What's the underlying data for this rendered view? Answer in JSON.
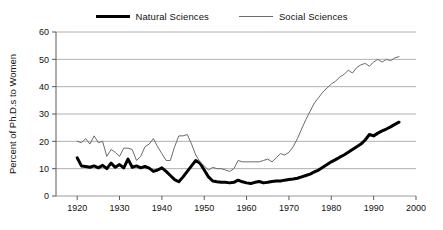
{
  "legend": {
    "position": "top-center",
    "entries": [
      {
        "label": "Natural Sciences",
        "style": "thick",
        "color": "#000000"
      },
      {
        "label": "Social Sciences",
        "style": "thin",
        "color": "#6b6b6b"
      }
    ]
  },
  "axes": {
    "y_title": "Percent of Ph.D.s to Women",
    "y_ticks": [
      "0",
      "10",
      "20",
      "30",
      "40",
      "50",
      "60"
    ],
    "x_ticks": [
      "1920",
      "1930",
      "1940",
      "1950",
      "1960",
      "1970",
      "1980",
      "1990",
      "2000"
    ]
  },
  "chart_data": {
    "type": "line",
    "title": "",
    "xlabel": "",
    "ylabel": "Percent of Ph.D.s to Women",
    "xlim": [
      1915,
      2000
    ],
    "ylim": [
      0,
      60
    ],
    "xticks": [
      1920,
      1930,
      1940,
      1950,
      1960,
      1970,
      1980,
      1990,
      2000
    ],
    "yticks": [
      0,
      10,
      20,
      30,
      40,
      50,
      60
    ],
    "grid": "horizontal",
    "legend_position": "top-center",
    "series": [
      {
        "name": "Natural Sciences",
        "color": "#000000",
        "linewidth": 3,
        "x": [
          1920,
          1921,
          1922,
          1923,
          1924,
          1925,
          1926,
          1927,
          1928,
          1929,
          1930,
          1931,
          1932,
          1933,
          1934,
          1935,
          1936,
          1937,
          1938,
          1939,
          1940,
          1941,
          1942,
          1943,
          1944,
          1945,
          1946,
          1947,
          1948,
          1949,
          1950,
          1951,
          1952,
          1953,
          1954,
          1955,
          1956,
          1957,
          1958,
          1959,
          1960,
          1961,
          1962,
          1963,
          1964,
          1965,
          1966,
          1967,
          1968,
          1969,
          1970,
          1971,
          1972,
          1973,
          1974,
          1975,
          1976,
          1977,
          1978,
          1979,
          1980,
          1981,
          1982,
          1983,
          1984,
          1985,
          1986,
          1987,
          1988,
          1989,
          1990,
          1991,
          1992,
          1993,
          1994,
          1995,
          1996
        ],
        "y": [
          14.0,
          11.0,
          10.8,
          10.5,
          11.0,
          10.3,
          11.2,
          10.0,
          12.0,
          10.5,
          11.5,
          10.3,
          13.5,
          10.5,
          11.0,
          10.3,
          10.8,
          10.2,
          9.0,
          9.5,
          10.3,
          9.0,
          7.5,
          6.0,
          5.2,
          7.0,
          9.0,
          11.0,
          13.0,
          12.0,
          9.5,
          7.0,
          5.5,
          5.2,
          5.0,
          5.0,
          4.8,
          5.0,
          5.8,
          5.2,
          4.8,
          4.6,
          5.0,
          5.3,
          4.8,
          5.0,
          5.3,
          5.5,
          5.5,
          5.8,
          6.0,
          6.2,
          6.5,
          7.0,
          7.5,
          8.0,
          8.8,
          9.5,
          10.5,
          11.5,
          12.5,
          13.3,
          14.2,
          15.0,
          16.0,
          17.0,
          18.0,
          19.0,
          20.5,
          22.5,
          22.0,
          23.0,
          23.8,
          24.5,
          25.3,
          26.2,
          27.0
        ]
      },
      {
        "name": "Social Sciences",
        "color": "#6b6b6b",
        "linewidth": 1,
        "x": [
          1920,
          1921,
          1922,
          1923,
          1924,
          1925,
          1926,
          1927,
          1928,
          1929,
          1930,
          1931,
          1932,
          1933,
          1934,
          1935,
          1936,
          1937,
          1938,
          1939,
          1940,
          1941,
          1942,
          1943,
          1944,
          1945,
          1946,
          1947,
          1948,
          1949,
          1950,
          1951,
          1952,
          1953,
          1954,
          1955,
          1956,
          1957,
          1958,
          1959,
          1960,
          1961,
          1962,
          1963,
          1964,
          1965,
          1966,
          1967,
          1968,
          1969,
          1970,
          1971,
          1972,
          1973,
          1974,
          1975,
          1976,
          1977,
          1978,
          1979,
          1980,
          1981,
          1982,
          1983,
          1984,
          1985,
          1986,
          1987,
          1988,
          1989,
          1990,
          1991,
          1992,
          1993,
          1994,
          1995,
          1996
        ],
        "y": [
          20.0,
          19.5,
          21.0,
          19.0,
          22.0,
          19.5,
          20.0,
          14.5,
          17.0,
          16.0,
          14.5,
          17.5,
          17.5,
          17.0,
          13.0,
          14.5,
          18.0,
          19.0,
          21.0,
          18.0,
          15.5,
          13.0,
          13.0,
          18.0,
          22.0,
          22.0,
          22.5,
          19.0,
          15.0,
          12.5,
          11.0,
          9.5,
          10.5,
          10.0,
          10.0,
          9.5,
          9.0,
          10.0,
          13.0,
          12.5,
          12.5,
          12.5,
          12.5,
          12.5,
          13.0,
          13.5,
          12.5,
          14.0,
          15.5,
          15.0,
          16.0,
          18.0,
          21.0,
          24.5,
          28.0,
          31.0,
          34.0,
          36.0,
          38.0,
          39.5,
          41.0,
          42.0,
          43.5,
          44.5,
          46.0,
          45.0,
          47.0,
          48.0,
          48.5,
          47.5,
          49.0,
          50.0,
          49.0,
          50.0,
          49.5,
          50.5,
          51.0
        ]
      }
    ]
  }
}
